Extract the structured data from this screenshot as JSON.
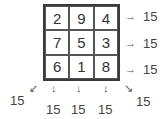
{
  "magic_square": {
    "rows": [
      [
        "2",
        "9",
        "4"
      ],
      [
        "7",
        "5",
        "3"
      ],
      [
        "6",
        "1",
        "8"
      ]
    ],
    "row_sums": [
      "15",
      "15",
      "15"
    ],
    "column_sums": [
      "15",
      "15",
      "15"
    ],
    "diagonal_sums": {
      "anti": "15",
      "main": "15"
    }
  },
  "arrows": {
    "right": "→",
    "down": "↓",
    "down_left": "↙",
    "down_right": "↘"
  }
}
